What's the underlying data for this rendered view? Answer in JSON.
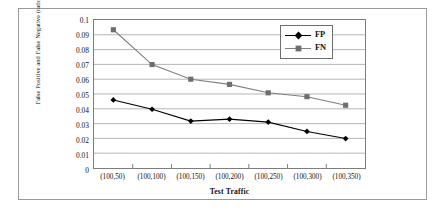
{
  "chart_data": {
    "type": "line",
    "title": "",
    "xlabel": "Test Traffic",
    "ylabel": "False Positive and False Negative (ratio)",
    "categories": [
      "(100,50)",
      "(100,100)",
      "(100,150)",
      "(100,200)",
      "(100,250)",
      "(100,300)",
      "(100,350)"
    ],
    "series": [
      {
        "name": "FP",
        "marker": "diamond",
        "color": "#000000",
        "values": [
          0.046,
          0.0397,
          0.0317,
          0.033,
          0.031,
          0.0247,
          0.0199
        ]
      },
      {
        "name": "FN",
        "marker": "square",
        "color": "#808080",
        "values": [
          0.0934,
          0.0699,
          0.06,
          0.0565,
          0.0508,
          0.0482,
          0.0424
        ]
      }
    ],
    "ylim": [
      0,
      0.1
    ],
    "ytick_labels": [
      "0.1",
      "0.09",
      "0.08",
      "0.07",
      "0.06",
      "0.05",
      "0.04",
      "0.03",
      "0.02",
      "0.01",
      "0"
    ],
    "ytick_values": [
      0.1,
      0.09,
      0.08,
      0.07,
      0.06,
      0.05,
      0.04,
      0.03,
      0.02,
      0.01,
      0
    ],
    "grid": true,
    "grid_color": "#b4b4b4",
    "legend_position": "top-right",
    "legend_entries": [
      "FP",
      "FN"
    ],
    "axis_color": "#7d7d7d",
    "background": "#ffffff"
  }
}
